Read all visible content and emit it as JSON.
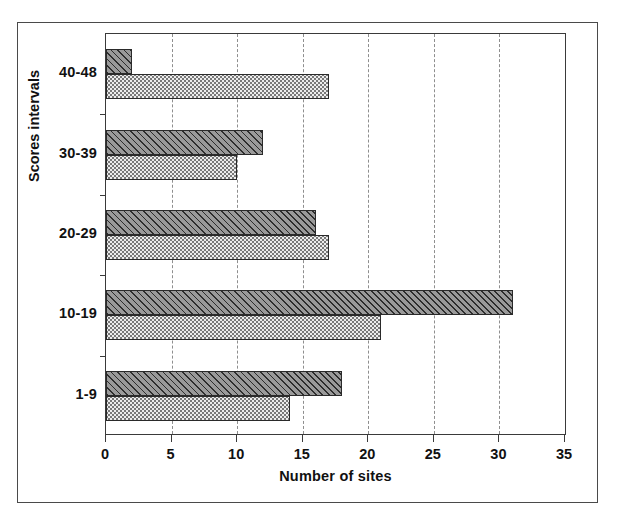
{
  "chart_data": {
    "type": "bar",
    "orientation": "horizontal",
    "title": "",
    "xlabel": "Number of sites",
    "ylabel": "Scores intervals",
    "categories": [
      "1-9",
      "10-19",
      "20-29",
      "30-39",
      "40-48"
    ],
    "series": [
      {
        "name": "hatched-series",
        "values": [
          18,
          31,
          16,
          12,
          2
        ],
        "fill": "diagonal-hatch",
        "color": "#9a9a9a"
      },
      {
        "name": "dotted-series",
        "values": [
          14,
          21,
          17,
          10,
          17
        ],
        "fill": "stipple-dots",
        "color": "#ececec"
      }
    ],
    "xlim": [
      0,
      35
    ],
    "xticks": [
      0,
      5,
      10,
      15,
      20,
      25,
      30,
      35
    ],
    "xtick_labels": [
      "0",
      "5",
      "10",
      "15",
      "20",
      "25",
      "30",
      "35"
    ],
    "grid": {
      "vertical": true,
      "style": "dashed",
      "at": [
        5,
        10,
        15,
        20,
        25,
        30
      ]
    },
    "legend": null,
    "frame": true
  },
  "axes": {
    "y_title": "Scores intervals",
    "x_title": "Number of sites"
  }
}
